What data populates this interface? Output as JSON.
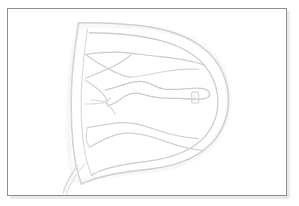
{
  "document": {
    "kind": "scanned-line-drawing-plate",
    "caption": "",
    "background_color": "#ffffff"
  },
  "frame": {
    "name": "plate-border",
    "border_color": "#8d8d8d",
    "shadow_color": "#d9d9d9",
    "fill_color": "#ffffff",
    "x": 7,
    "y": 8,
    "width": 280,
    "height": 188
  },
  "figure": {
    "title": "",
    "stroke_color": "#c9c9c9",
    "stroke_color_light": "#dcdcdc",
    "stroke_color_faint": "#e6e6e6",
    "fill_color": "#fdfdfd",
    "stroke_width": 1.1,
    "marker": {
      "name": "small-rounded-rectangle-marker",
      "x": 192,
      "y": 92,
      "width": 7,
      "height": 11,
      "radius": 1.6,
      "stroke_color": "#d2d2d2"
    },
    "elements": [
      {
        "label": "outer-d-contour"
      },
      {
        "label": "inner-d-contour"
      },
      {
        "label": "upper-branch-contour"
      },
      {
        "label": "mid-tongue-contour"
      },
      {
        "label": "lower-sweep-contour"
      },
      {
        "label": "left-spine-contour"
      },
      {
        "label": "lower-left-tail"
      }
    ]
  }
}
